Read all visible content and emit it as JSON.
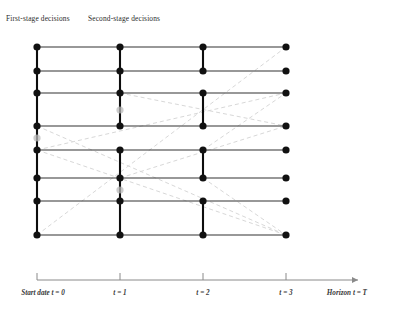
{
  "figure": {
    "type": "scenario-tree",
    "background": "#ffffff",
    "node_color": "#111111",
    "ghost_node_color": "#b9b9b9",
    "solid_line_color": "#333333",
    "bundle_line_color": "#0d0d0d",
    "dashed_line_color": "#d8d8d8",
    "axis_color": "#8a8a8a"
  },
  "headers": {
    "first_stage": "First-stage decisions",
    "second_stage": "Second-stage decisions"
  },
  "timeline": {
    "ticks": [
      {
        "id": "t0",
        "label": "Start date t = 0",
        "x": 37
      },
      {
        "id": "t1",
        "label": "t = 1",
        "x": 120
      },
      {
        "id": "t2",
        "label": "t = 2",
        "x": 203
      },
      {
        "id": "t3",
        "label": "t = 3",
        "x": 286
      },
      {
        "id": "tT",
        "label": "Horizon t = T",
        "x": 355
      }
    ],
    "axis_y": 280,
    "axis_x_start": 37,
    "axis_x_end": 358
  },
  "chart_data": {
    "type": "scatter",
    "columns_x": [
      37,
      120,
      203,
      286
    ],
    "rows_y": [
      47,
      71,
      93,
      126,
      150,
      178,
      201,
      235
    ],
    "node_count": 32,
    "node_radius": 3.6,
    "bundles": [
      {
        "column": 0,
        "from_row": 0,
        "to_row": 7
      },
      {
        "column": 1,
        "from_row": 0,
        "to_row": 3
      },
      {
        "column": 1,
        "from_row": 4,
        "to_row": 7
      },
      {
        "column": 2,
        "from_row": 0,
        "to_row": 1
      },
      {
        "column": 2,
        "from_row": 2,
        "to_row": 3
      },
      {
        "column": 2,
        "from_row": 4,
        "to_row": 5
      },
      {
        "column": 2,
        "from_row": 6,
        "to_row": 7
      }
    ],
    "scenario_paths": [
      {
        "row": 0,
        "x_from": 37,
        "x_to": 286
      },
      {
        "row": 1,
        "x_from": 37,
        "x_to": 286
      },
      {
        "row": 2,
        "x_from": 37,
        "x_to": 286
      },
      {
        "row": 3,
        "x_from": 37,
        "x_to": 286
      },
      {
        "row": 4,
        "x_from": 37,
        "x_to": 286
      },
      {
        "row": 5,
        "x_from": 37,
        "x_to": 286
      },
      {
        "row": 6,
        "x_from": 37,
        "x_to": 286
      },
      {
        "row": 7,
        "x_from": 37,
        "x_to": 286
      }
    ],
    "dashed_links": [
      {
        "x1": 37,
        "y1": 235,
        "x2": 286,
        "y2": 47
      },
      {
        "x1": 37,
        "y1": 150,
        "x2": 286,
        "y2": 93
      },
      {
        "x1": 37,
        "y1": 126,
        "x2": 286,
        "y2": 235
      },
      {
        "x1": 37,
        "y1": 150,
        "x2": 286,
        "y2": 235
      },
      {
        "x1": 120,
        "y1": 93,
        "x2": 286,
        "y2": 126
      },
      {
        "x1": 120,
        "y1": 178,
        "x2": 286,
        "y2": 126
      },
      {
        "x1": 203,
        "y1": 150,
        "x2": 286,
        "y2": 93
      },
      {
        "x1": 203,
        "y1": 178,
        "x2": 286,
        "y2": 235
      }
    ],
    "ghost_nodes": [
      {
        "x": 37,
        "y": 138
      },
      {
        "x": 120,
        "y": 110
      },
      {
        "x": 120,
        "y": 190
      }
    ],
    "xlabel": "time",
    "ylabel": "scenarios",
    "legend": []
  }
}
